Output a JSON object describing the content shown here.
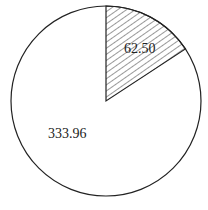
{
  "chart_data": {
    "type": "pie",
    "title": "",
    "slices": [
      {
        "label": "62.50",
        "value": 62.5,
        "pattern": "hatched"
      },
      {
        "label": "333.96",
        "value": 333.96,
        "pattern": "none"
      }
    ],
    "start_angle_deg": 0,
    "direction": "clockwise",
    "colors": {
      "stroke": "#222222",
      "fill": "#ffffff",
      "hatch": "#333333"
    }
  }
}
